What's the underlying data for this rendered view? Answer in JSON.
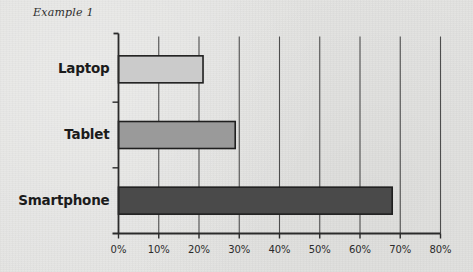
{
  "caption": "Example 1",
  "chart_data": {
    "type": "bar",
    "orientation": "horizontal",
    "title": "",
    "xlabel": "",
    "ylabel": "",
    "categories": [
      "Laptop",
      "Tablet",
      "Smartphone"
    ],
    "values": [
      21,
      29,
      68
    ],
    "value_suffix": "%",
    "xlim": [
      0,
      80
    ],
    "xticks": [
      0,
      10,
      20,
      30,
      40,
      50,
      60,
      70,
      80
    ],
    "xtick_labels": [
      "0%",
      "10%",
      "20%",
      "30%",
      "40%",
      "50%",
      "60%",
      "70%",
      "80%"
    ],
    "grid": "vertical",
    "legend": "none",
    "bar_colors": [
      "#cbcbcb",
      "#9a9a9a",
      "#4a4a4a"
    ],
    "bar_edge_color": "#1f1f1f",
    "axis_color": "#2a2a2a",
    "gridline_color": "#4d4d4d",
    "background_color": "#e3e3e1",
    "series": [
      {
        "name": "Share",
        "values": [
          21,
          29,
          68
        ]
      }
    ]
  }
}
